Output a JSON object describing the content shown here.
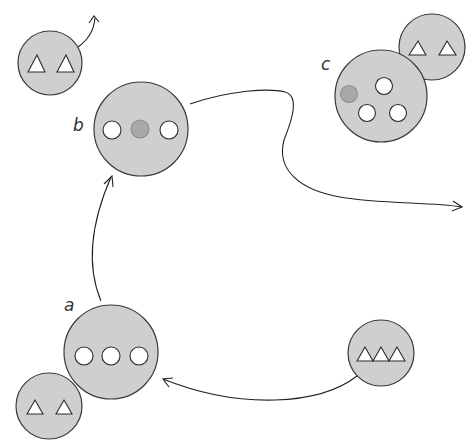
{
  "diagram": {
    "title": "",
    "colors": {
      "cell_fill": "#cfcfcf",
      "outline": "#3a3a3a",
      "hole_fill": "#ffffff",
      "filled_hole": "#a9a9a9"
    },
    "labels": {
      "a": "a",
      "b": "b",
      "c": "c"
    },
    "nodes": [
      {
        "id": "free-two-triangles",
        "shape": "circle",
        "contents": "2 triangles"
      },
      {
        "id": "b",
        "shape": "circle",
        "contents": "2 empty sites, 1 filled site"
      },
      {
        "id": "c",
        "shape": "circle",
        "contents": "3 empty sites, 1 filled site, bound to circle with 2 triangles"
      },
      {
        "id": "a",
        "shape": "circle",
        "contents": "3 empty sites, bound to circle with 2 triangles"
      },
      {
        "id": "three-triangles",
        "shape": "circle",
        "contents": "3 triangles"
      }
    ],
    "arrows": [
      {
        "from": "three-triangles",
        "to": "a"
      },
      {
        "from": "a",
        "to": "b"
      },
      {
        "from": "b",
        "to": "exit-right"
      },
      {
        "from": "free-two-triangles",
        "to": "exit-top"
      }
    ]
  }
}
